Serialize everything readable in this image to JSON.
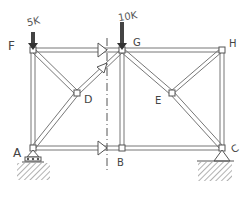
{
  "diagram": {
    "type": "truss-method-of-sections",
    "joints": [
      {
        "id": "F",
        "label": "F",
        "x": 33,
        "y": 50,
        "lx": 8,
        "ly": 49
      },
      {
        "id": "G",
        "label": "G",
        "x": 122,
        "y": 50,
        "lx": 133,
        "ly": 45
      },
      {
        "id": "H",
        "label": "H",
        "x": 222,
        "y": 50,
        "lx": 229,
        "ly": 47
      },
      {
        "id": "D",
        "label": "D",
        "x": 77,
        "y": 93,
        "lx": 85,
        "ly": 101
      },
      {
        "id": "E",
        "label": "E",
        "x": 172,
        "y": 93,
        "lx": 158,
        "ly": 101
      },
      {
        "id": "A",
        "label": "A",
        "x": 33,
        "y": 148,
        "lx": 13,
        "ly": 155
      },
      {
        "id": "B",
        "label": "B",
        "x": 122,
        "y": 148,
        "lx": 120,
        "ly": 165
      },
      {
        "id": "C",
        "label": "C",
        "x": 222,
        "y": 148,
        "lx": 232,
        "ly": 150
      }
    ],
    "members": [
      [
        "F",
        "G"
      ],
      [
        "G",
        "H"
      ],
      [
        "A",
        "B"
      ],
      [
        "B",
        "C"
      ],
      [
        "F",
        "A"
      ],
      [
        "G",
        "B"
      ],
      [
        "H",
        "C"
      ],
      [
        "F",
        "D"
      ],
      [
        "D",
        "B"
      ],
      [
        "A",
        "D"
      ],
      [
        "D",
        "G"
      ],
      [
        "G",
        "E"
      ],
      [
        "E",
        "C"
      ],
      [
        "H",
        "E"
      ]
    ],
    "loads": [
      {
        "joint": "F",
        "label": "5K",
        "x": 33,
        "y": 50
      },
      {
        "joint": "G",
        "label": "10K",
        "x": 122,
        "y": 50
      }
    ],
    "supports": [
      {
        "joint": "A",
        "type": "roller"
      },
      {
        "joint": "C",
        "type": "pin"
      }
    ],
    "section_cut": {
      "x": 107,
      "y_top": 38,
      "y_bottom": 170,
      "style": "dash-dot"
    },
    "section_forces": [
      {
        "member": "FG",
        "direction": "right"
      },
      {
        "member": "DG",
        "direction": "up-right"
      },
      {
        "member": "AB",
        "direction": "right"
      }
    ]
  },
  "labels": {
    "F": "F",
    "G": "G",
    "H": "H",
    "D": "D",
    "E": "E",
    "A": "A",
    "B": "B",
    "C": "C",
    "load_F": "5K",
    "load_G": "10K"
  }
}
